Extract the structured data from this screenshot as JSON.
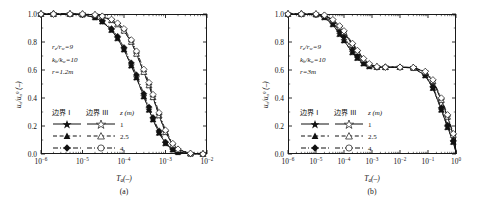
{
  "figure": {
    "panels": [
      {
        "id": "a",
        "sublabel": "(a)",
        "annotations": [
          "r_e/r_w=9",
          "k_h/k_w=10",
          "r=1.2m"
        ],
        "annot_parts": [
          {
            "base": "r",
            "sub": "e",
            "mid": "/",
            "base2": "r",
            "sub2": "w",
            "tail": "=9"
          },
          {
            "base": "k",
            "sub": "h",
            "mid": "/",
            "base2": "k",
            "sub2": "w",
            "tail": "=10"
          },
          {
            "base": "r",
            "sub": "",
            "mid": "",
            "base2": "",
            "sub2": "",
            "tail": "=1.2m"
          }
        ]
      },
      {
        "id": "b",
        "sublabel": "(b)",
        "annotations": [
          "r_e/r_w=9",
          "k_h/k_w=10",
          "r=3m"
        ],
        "annot_parts": [
          {
            "base": "r",
            "sub": "e",
            "mid": "/",
            "base2": "r",
            "sub2": "w",
            "tail": "=9"
          },
          {
            "base": "k",
            "sub": "h",
            "mid": "/",
            "base2": "k",
            "sub2": "w",
            "tail": "=10"
          },
          {
            "base": "r",
            "sub": "",
            "mid": "",
            "base2": "",
            "sub2": "",
            "tail": "=3m"
          }
        ]
      }
    ],
    "legend": {
      "col1_header": "边界 I",
      "col2_header": "边界 III",
      "z_header_symbol": "z",
      "z_header_unit": "(m)",
      "rows": [
        {
          "z": "1",
          "marker": "star",
          "line": "solid"
        },
        {
          "z": "2.5",
          "marker": "triangle",
          "line": "dashed"
        },
        {
          "z": "4",
          "marker": "diamond",
          "line": "dashdot"
        }
      ]
    },
    "caption_fragment": ""
  },
  "chart_data": [
    {
      "type": "line",
      "panel": "a",
      "title": "(a)",
      "xlabel": "T_a(-)",
      "ylabel": "u_a/u_a^0 (-)",
      "xscale": "log",
      "xlim": [
        1e-06,
        0.01
      ],
      "ylim": [
        0.0,
        1.0
      ],
      "xticks": [
        "10^-6",
        "10^-5",
        "10^-4",
        "10^-3",
        "10^-2"
      ],
      "yticks": [
        "0.0",
        "0.2",
        "0.4",
        "0.6",
        "0.8",
        "1.0"
      ],
      "grid": false,
      "legend_position": "inside-left",
      "series": [
        {
          "name": "边界 I, z=1 m",
          "boundary": "I",
          "z": 1,
          "marker": "star",
          "fill": "filled",
          "line": "solid",
          "x": [
            1e-06,
            2e-06,
            5e-06,
            1e-05,
            2e-05,
            3e-05,
            5e-05,
            7e-05,
            0.0001,
            0.00015,
            0.0002,
            0.0003,
            0.0004,
            0.0005,
            0.0007,
            0.001,
            0.0015,
            0.002,
            0.004,
            0.008
          ],
          "y": [
            1.0,
            1.0,
            1.0,
            0.995,
            0.975,
            0.945,
            0.885,
            0.825,
            0.745,
            0.63,
            0.545,
            0.41,
            0.315,
            0.245,
            0.15,
            0.075,
            0.03,
            0.012,
            0.002,
            0.0
          ]
        },
        {
          "name": "边界 I, z=2.5 m",
          "boundary": "I",
          "z": 2.5,
          "marker": "triangle",
          "fill": "filled",
          "line": "dashed",
          "x": [
            1e-06,
            2e-06,
            5e-06,
            1e-05,
            2e-05,
            3e-05,
            5e-05,
            7e-05,
            0.0001,
            0.00015,
            0.0002,
            0.0003,
            0.0004,
            0.0005,
            0.0007,
            0.001,
            0.0015,
            0.002,
            0.004,
            0.008
          ],
          "y": [
            1.0,
            1.0,
            1.0,
            0.995,
            0.975,
            0.945,
            0.885,
            0.825,
            0.745,
            0.63,
            0.545,
            0.41,
            0.315,
            0.245,
            0.15,
            0.075,
            0.03,
            0.012,
            0.002,
            0.0
          ]
        },
        {
          "name": "边界 I, z=4 m",
          "boundary": "I",
          "z": 4,
          "marker": "diamond",
          "fill": "filled",
          "line": "dashdot",
          "x": [
            1e-06,
            2e-06,
            5e-06,
            1e-05,
            2e-05,
            3e-05,
            5e-05,
            7e-05,
            0.0001,
            0.00015,
            0.0002,
            0.0003,
            0.0004,
            0.0005,
            0.0007,
            0.001,
            0.0015,
            0.002,
            0.004,
            0.008
          ],
          "y": [
            1.0,
            1.0,
            1.0,
            0.995,
            0.978,
            0.95,
            0.895,
            0.84,
            0.76,
            0.65,
            0.565,
            0.43,
            0.335,
            0.26,
            0.165,
            0.085,
            0.035,
            0.015,
            0.002,
            0.0
          ]
        },
        {
          "name": "边界 III, z=1 m",
          "boundary": "III",
          "z": 1,
          "marker": "star",
          "fill": "open",
          "line": "solid",
          "x": [
            1e-06,
            2e-06,
            5e-06,
            1e-05,
            2e-05,
            3e-05,
            5e-05,
            7e-05,
            0.0001,
            0.00015,
            0.0002,
            0.0003,
            0.0004,
            0.0005,
            0.0007,
            0.001,
            0.0015,
            0.002,
            0.004,
            0.008
          ],
          "y": [
            1.0,
            1.0,
            1.0,
            1.0,
            0.993,
            0.982,
            0.955,
            0.925,
            0.88,
            0.8,
            0.715,
            0.585,
            0.49,
            0.405,
            0.275,
            0.155,
            0.065,
            0.03,
            0.004,
            0.0
          ]
        },
        {
          "name": "边界 III, z=2.5 m",
          "boundary": "III",
          "z": 2.5,
          "marker": "triangle",
          "fill": "open",
          "line": "dashed",
          "x": [
            1e-06,
            2e-06,
            5e-06,
            1e-05,
            2e-05,
            3e-05,
            5e-05,
            7e-05,
            0.0001,
            0.00015,
            0.0002,
            0.0003,
            0.0004,
            0.0005,
            0.0007,
            0.001,
            0.0015,
            0.002,
            0.004,
            0.008
          ],
          "y": [
            1.0,
            1.0,
            1.0,
            1.0,
            0.993,
            0.982,
            0.955,
            0.925,
            0.88,
            0.8,
            0.715,
            0.585,
            0.49,
            0.405,
            0.275,
            0.155,
            0.065,
            0.03,
            0.004,
            0.0
          ]
        },
        {
          "name": "边界 III, z=4 m",
          "boundary": "III",
          "z": 4,
          "marker": "diamond",
          "fill": "open",
          "line": "dashdot",
          "x": [
            1e-06,
            2e-06,
            5e-06,
            1e-05,
            2e-05,
            3e-05,
            5e-05,
            7e-05,
            0.0001,
            0.00015,
            0.0002,
            0.0003,
            0.0004,
            0.0005,
            0.0007,
            0.001,
            0.0015,
            0.002,
            0.004,
            0.008
          ],
          "y": [
            1.0,
            1.0,
            1.0,
            1.0,
            0.995,
            0.985,
            0.962,
            0.935,
            0.895,
            0.815,
            0.735,
            0.605,
            0.51,
            0.425,
            0.295,
            0.17,
            0.075,
            0.035,
            0.005,
            0.0
          ]
        }
      ]
    },
    {
      "type": "line",
      "panel": "b",
      "title": "(b)",
      "xlabel": "T_a(-)",
      "ylabel": "u_a/u_a^0 (-)",
      "xscale": "log",
      "xlim": [
        1e-06,
        1.0
      ],
      "ylim": [
        0.0,
        1.0
      ],
      "xticks": [
        "10^-6",
        "10^-5",
        "10^-4",
        "10^-3",
        "10^-2",
        "10^-1",
        "10^0"
      ],
      "yticks": [
        "0.0",
        "0.2",
        "0.4",
        "0.6",
        "0.8",
        "1.0"
      ],
      "grid": false,
      "legend_position": "inside-left",
      "plateau_value": 0.62,
      "series": [
        {
          "name": "边界 I, z=1 m",
          "boundary": "I",
          "z": 1,
          "marker": "star",
          "fill": "filled",
          "line": "solid",
          "x": [
            1e-06,
            3e-06,
            1e-05,
            2e-05,
            4e-05,
            7e-05,
            0.0001,
            0.0002,
            0.0003,
            0.0005,
            0.0008,
            0.0015,
            0.003,
            0.01,
            0.03,
            0.08,
            0.15,
            0.3,
            0.5,
            0.8,
            1.5,
            4.0
          ],
          "y": [
            1.0,
            1.0,
            0.995,
            0.975,
            0.925,
            0.855,
            0.81,
            0.725,
            0.685,
            0.645,
            0.625,
            0.62,
            0.62,
            0.62,
            0.615,
            0.56,
            0.47,
            0.315,
            0.19,
            0.085,
            0.01,
            0.0
          ]
        },
        {
          "name": "边界 I, z=2.5 m",
          "boundary": "I",
          "z": 2.5,
          "marker": "triangle",
          "fill": "filled",
          "line": "dashed",
          "x": [
            1e-06,
            3e-06,
            1e-05,
            2e-05,
            4e-05,
            7e-05,
            0.0001,
            0.0002,
            0.0003,
            0.0005,
            0.0008,
            0.0015,
            0.003,
            0.01,
            0.03,
            0.08,
            0.15,
            0.3,
            0.5,
            0.8,
            1.5,
            4.0
          ],
          "y": [
            1.0,
            1.0,
            0.995,
            0.975,
            0.925,
            0.855,
            0.81,
            0.725,
            0.685,
            0.645,
            0.625,
            0.62,
            0.62,
            0.62,
            0.615,
            0.56,
            0.47,
            0.315,
            0.19,
            0.085,
            0.01,
            0.0
          ]
        },
        {
          "name": "边界 I, z=4 m",
          "boundary": "I",
          "z": 4,
          "marker": "diamond",
          "fill": "filled",
          "line": "dashdot",
          "x": [
            1e-06,
            3e-06,
            1e-05,
            2e-05,
            4e-05,
            7e-05,
            0.0001,
            0.0002,
            0.0003,
            0.0005,
            0.0008,
            0.0015,
            0.003,
            0.01,
            0.03,
            0.08,
            0.15,
            0.3,
            0.5,
            0.8,
            1.5,
            4.0
          ],
          "y": [
            1.0,
            1.0,
            0.997,
            0.982,
            0.94,
            0.875,
            0.835,
            0.745,
            0.7,
            0.655,
            0.63,
            0.62,
            0.62,
            0.62,
            0.615,
            0.565,
            0.48,
            0.33,
            0.205,
            0.095,
            0.012,
            0.0
          ]
        },
        {
          "name": "边界 III, z=1 m",
          "boundary": "III",
          "z": 1,
          "marker": "star",
          "fill": "open",
          "line": "solid",
          "x": [
            1e-06,
            3e-06,
            1e-05,
            2e-05,
            4e-05,
            7e-05,
            0.0001,
            0.0002,
            0.0003,
            0.0005,
            0.0008,
            0.0015,
            0.003,
            0.01,
            0.03,
            0.08,
            0.15,
            0.3,
            0.5,
            0.8,
            1.5,
            4.0
          ],
          "y": [
            1.0,
            1.0,
            1.0,
            0.99,
            0.955,
            0.905,
            0.87,
            0.78,
            0.73,
            0.675,
            0.64,
            0.622,
            0.62,
            0.62,
            0.618,
            0.585,
            0.52,
            0.385,
            0.265,
            0.135,
            0.02,
            0.0
          ]
        },
        {
          "name": "边界 III, z=2.5 m",
          "boundary": "III",
          "z": 2.5,
          "marker": "triangle",
          "fill": "open",
          "line": "dashed",
          "x": [
            1e-06,
            3e-06,
            1e-05,
            2e-05,
            4e-05,
            7e-05,
            0.0001,
            0.0002,
            0.0003,
            0.0005,
            0.0008,
            0.0015,
            0.003,
            0.01,
            0.03,
            0.08,
            0.15,
            0.3,
            0.5,
            0.8,
            1.5,
            4.0
          ],
          "y": [
            1.0,
            1.0,
            1.0,
            0.99,
            0.955,
            0.905,
            0.87,
            0.78,
            0.73,
            0.675,
            0.64,
            0.622,
            0.62,
            0.62,
            0.618,
            0.585,
            0.52,
            0.385,
            0.265,
            0.135,
            0.02,
            0.0
          ]
        },
        {
          "name": "边界 III, z=4 m",
          "boundary": "III",
          "z": 4,
          "marker": "diamond",
          "fill": "open",
          "line": "dashdot",
          "x": [
            1e-06,
            3e-06,
            1e-05,
            2e-05,
            4e-05,
            7e-05,
            0.0001,
            0.0002,
            0.0003,
            0.0005,
            0.0008,
            0.0015,
            0.003,
            0.01,
            0.03,
            0.08,
            0.15,
            0.3,
            0.5,
            0.8,
            1.5,
            4.0
          ],
          "y": [
            1.0,
            1.0,
            1.0,
            0.992,
            0.96,
            0.915,
            0.88,
            0.79,
            0.74,
            0.682,
            0.645,
            0.624,
            0.62,
            0.62,
            0.618,
            0.59,
            0.53,
            0.4,
            0.28,
            0.145,
            0.022,
            0.0
          ]
        }
      ]
    }
  ]
}
